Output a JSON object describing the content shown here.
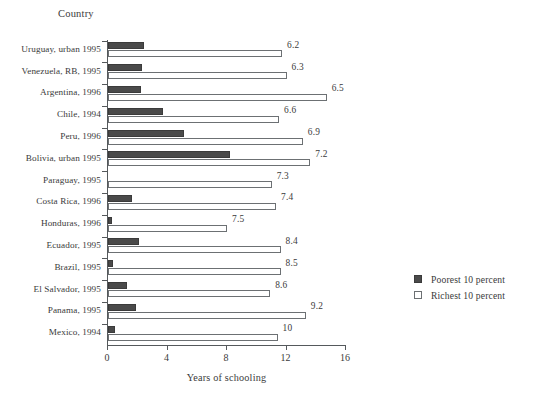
{
  "chart_data": {
    "type": "bar",
    "orientation": "horizontal",
    "title": "",
    "xlabel": "Years of schooling",
    "ylabel": "Country",
    "xlim": [
      0,
      16
    ],
    "xticks": [
      0,
      4,
      8,
      12,
      16
    ],
    "grid": false,
    "legend_position": "right",
    "categories": [
      "Uruguay, urban 1995",
      "Venezuela, RB, 1995",
      "Argentina, 1996",
      "Chile, 1994",
      "Peru, 1996",
      "Bolivia, urban 1995",
      "Paraguay, 1995",
      "Costa Rica, 1996",
      "Honduras, 1996",
      "Ecuador, 1995",
      "Brazil, 1995",
      "El Salvador, 1995",
      "Panama, 1995",
      "Mexico, 1994"
    ],
    "series": [
      {
        "name": "Poorest 10 percent",
        "color": "#4a4a4a",
        "values": [
          2.4,
          2.3,
          2.2,
          3.7,
          5.1,
          8.2,
          0.0,
          1.6,
          0.3,
          2.1,
          0.35,
          1.3,
          1.9,
          0.5
        ]
      },
      {
        "name": "Richest 10 percent",
        "color": "#ffffff",
        "values": [
          11.7,
          12.0,
          14.7,
          11.5,
          13.1,
          13.6,
          11.0,
          11.3,
          8.0,
          11.6,
          11.6,
          10.9,
          13.3,
          11.4
        ]
      }
    ],
    "annotations": [
      "6.2",
      "6.3",
      "6.5",
      "6.6",
      "6.9",
      "7.2",
      "7.3",
      "7.4",
      "7.5",
      "8.4",
      "8.5",
      "8.6",
      "9.2",
      "10"
    ],
    "annotation_note": "Ratio of richest to poorest years of schooling shown at end of each pair"
  },
  "legend": {
    "items": [
      {
        "label": "Poorest 10 percent",
        "swatch": "filled-dark-square"
      },
      {
        "label": "Richest 10 percent",
        "swatch": "open-white-square"
      }
    ]
  },
  "colors": {
    "bar_poor": "#4a4a4a",
    "bar_rich": "#ffffff",
    "bar_rich_border": "#6c7073",
    "axis": "#55595c",
    "text": "#3a3a3a",
    "background": "#ffffff"
  }
}
